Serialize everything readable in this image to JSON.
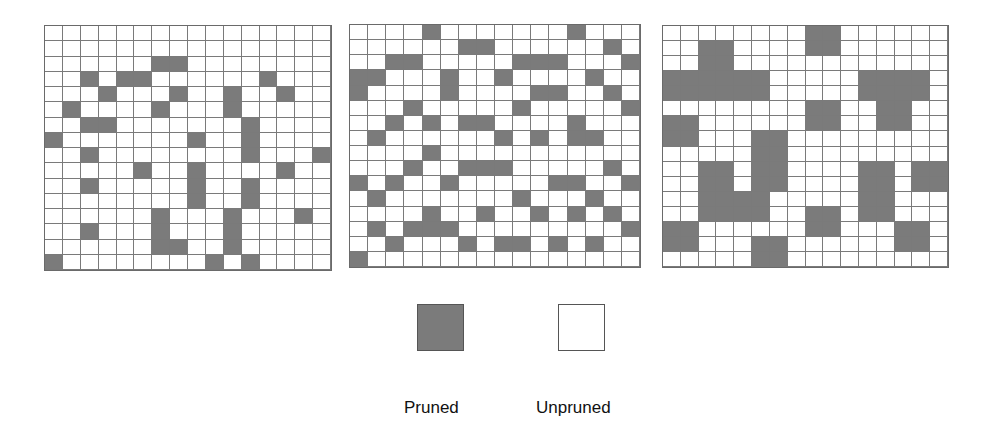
{
  "figure": {
    "grid_size": {
      "rows": 16,
      "cols": 16
    },
    "colors": {
      "pruned": "#7b7b7b",
      "unpruned": "#ffffff",
      "grid_line": "#7a7a7a"
    },
    "grids": [
      {
        "name": "grid-1",
        "pruned_cells": [
          [],
          [],
          [
            6,
            7
          ],
          [
            2,
            4,
            5,
            12
          ],
          [
            3,
            7,
            10,
            13
          ],
          [
            1,
            6,
            10
          ],
          [
            2,
            3,
            11
          ],
          [
            0,
            8,
            11
          ],
          [
            2,
            11,
            15
          ],
          [
            5,
            8,
            13
          ],
          [
            2,
            8,
            11
          ],
          [
            8,
            11
          ],
          [
            6,
            10,
            14
          ],
          [
            2,
            6,
            10
          ],
          [
            6,
            7,
            10
          ],
          [
            0,
            9,
            11
          ]
        ]
      },
      {
        "name": "grid-2",
        "pruned_cells": [
          [
            4,
            12
          ],
          [
            6,
            7,
            14
          ],
          [
            2,
            3,
            9,
            10,
            11,
            15
          ],
          [
            0,
            1,
            5,
            8,
            13
          ],
          [
            0,
            5,
            10,
            11,
            14
          ],
          [
            3,
            9,
            15
          ],
          [
            2,
            4,
            6,
            7,
            12
          ],
          [
            1,
            8,
            10,
            12,
            13
          ],
          [
            4
          ],
          [
            3,
            6,
            7,
            8,
            14
          ],
          [
            0,
            2,
            5,
            11,
            12,
            15
          ],
          [
            1,
            9,
            13
          ],
          [
            4,
            7,
            10,
            12,
            14
          ],
          [
            1,
            3,
            4,
            5,
            15
          ],
          [
            2,
            6,
            8,
            9,
            11,
            13
          ],
          [
            0
          ]
        ]
      },
      {
        "name": "grid-3",
        "pruned_cells": [
          [
            8,
            9
          ],
          [
            2,
            3,
            8,
            9
          ],
          [
            2,
            3
          ],
          [
            0,
            1,
            2,
            3,
            4,
            5,
            11,
            12,
            13,
            14
          ],
          [
            0,
            1,
            2,
            3,
            4,
            5,
            11,
            12,
            13,
            14
          ],
          [
            8,
            9,
            12,
            13
          ],
          [
            0,
            1,
            8,
            9,
            12,
            13
          ],
          [
            0,
            1,
            5,
            6
          ],
          [
            5,
            6
          ],
          [
            2,
            3,
            5,
            6,
            11,
            12,
            14,
            15
          ],
          [
            2,
            3,
            5,
            6,
            11,
            12,
            14,
            15
          ],
          [
            2,
            3,
            4,
            5,
            11,
            12
          ],
          [
            2,
            3,
            4,
            5,
            8,
            9,
            11,
            12
          ],
          [
            0,
            1,
            8,
            9,
            13,
            14
          ],
          [
            0,
            1,
            5,
            6,
            13,
            14
          ],
          [
            5,
            6
          ]
        ]
      }
    ]
  },
  "legend": {
    "pruned_label": "Pruned",
    "unpruned_label": "Unpruned"
  }
}
